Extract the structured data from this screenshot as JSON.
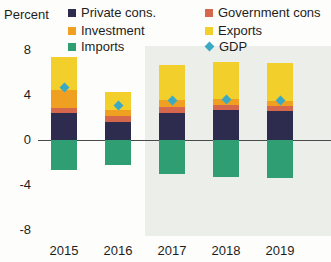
{
  "axis_unit_label": "Percent",
  "legend": [
    {
      "key": "private_cons",
      "label": "Private cons.",
      "color": "#2d2b4e",
      "marker": "square"
    },
    {
      "key": "government_cons",
      "label": "Government cons",
      "color": "#d4674c",
      "marker": "square"
    },
    {
      "key": "investment",
      "label": "Investment",
      "color": "#f0a021",
      "marker": "square"
    },
    {
      "key": "exports",
      "label": "Exports",
      "color": "#f2cf2a",
      "marker": "square"
    },
    {
      "key": "imports",
      "label": "Imports",
      "color": "#2f9e72",
      "marker": "square"
    },
    {
      "key": "gdp",
      "label": "GDP",
      "color": "#3ca9c4",
      "marker": "diamond"
    }
  ],
  "chart_data": {
    "type": "bar",
    "stacked": true,
    "title": "",
    "subtitle": "",
    "xlabel": "",
    "ylabel": "Percent",
    "ylim": [
      -8,
      8
    ],
    "yticks": [
      8,
      4,
      0,
      -4,
      -8
    ],
    "ytick_labels": [
      "8",
      "4",
      "0",
      "-4",
      "-8"
    ],
    "grid": false,
    "legend_position": "top",
    "categories": [
      "2015",
      "2016",
      "2017",
      "2018",
      "2019"
    ],
    "series": [
      {
        "name": "Private cons.",
        "color": "#2d2b4e",
        "values": [
          2.4,
          1.6,
          2.4,
          2.6,
          2.5
        ]
      },
      {
        "name": "Government cons",
        "color": "#d4674c",
        "values": [
          0.4,
          0.5,
          0.5,
          0.5,
          0.5
        ]
      },
      {
        "name": "Investment",
        "color": "#f0a021",
        "values": [
          1.6,
          0.5,
          0.6,
          0.5,
          0.4
        ]
      },
      {
        "name": "Exports",
        "color": "#f2cf2a",
        "values": [
          2.9,
          1.6,
          3.1,
          3.3,
          3.4
        ]
      },
      {
        "name": "Imports",
        "color": "#2f9e72",
        "values": [
          -2.7,
          -2.3,
          -3.1,
          -3.3,
          -3.4
        ]
      }
    ],
    "gdp_line": {
      "name": "GDP",
      "color": "#3ca9c4",
      "marker": "diamond",
      "values": [
        4.6,
        3.0,
        3.5,
        3.6,
        3.5
      ]
    },
    "forecast_region": {
      "start_category": "2017",
      "shaded": true,
      "shade_color": "#eceee9"
    }
  }
}
